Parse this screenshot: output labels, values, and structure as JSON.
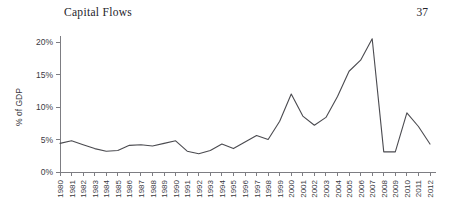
{
  "running_head": {
    "title": "Capital Flows",
    "page_number": "37"
  },
  "chart_data": {
    "type": "line",
    "title": "",
    "xlabel": "",
    "ylabel": "% of GDP",
    "ylim": [
      0,
      20
    ],
    "ytick_labels": [
      "0%",
      "5%",
      "10%",
      "15%",
      "20%"
    ],
    "ytick_values": [
      0,
      5,
      10,
      15,
      20
    ],
    "grid": false,
    "legend": "none",
    "categories": [
      "1980",
      "1981",
      "1982",
      "1983",
      "1984",
      "1985",
      "1986",
      "1987",
      "1988",
      "1989",
      "1990",
      "1991",
      "1992",
      "1993",
      "1994",
      "1995",
      "1996",
      "1997",
      "1998",
      "1999",
      "2000",
      "2001",
      "2002",
      "2003",
      "2004",
      "2005",
      "2006",
      "2007",
      "2008",
      "2009",
      "2010",
      "2011",
      "2012"
    ],
    "values": [
      4.4,
      4.8,
      4.2,
      3.6,
      3.2,
      3.3,
      4.1,
      4.2,
      4.0,
      4.4,
      4.8,
      3.2,
      2.8,
      3.3,
      4.3,
      3.6,
      4.6,
      5.6,
      5.0,
      7.8,
      12.0,
      8.6,
      7.2,
      8.4,
      11.6,
      15.5,
      17.2,
      20.5,
      3.1,
      3.1,
      9.1,
      7.0,
      4.3
    ],
    "series_color": "#4b4b50",
    "axis_color": "#7d7d82"
  }
}
